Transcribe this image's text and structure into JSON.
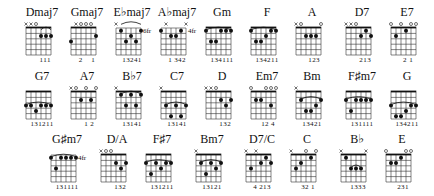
{
  "rows": [
    [
      {
        "name": "Dmaj7",
        "markers": [
          "x",
          "x",
          "o",
          "",
          "",
          ""
        ],
        "dots": [
          [
            3,
            2
          ],
          [
            4,
            2
          ],
          [
            5,
            2
          ]
        ],
        "barre": [
          3,
          5,
          1
        ],
        "pos": "",
        "fingers": "   111"
      },
      {
        "name": "Gmaj7",
        "markers": [
          "",
          "x",
          "o",
          "o",
          "o",
          ""
        ],
        "dots": [
          [
            0,
            3
          ],
          [
            5,
            2
          ]
        ],
        "barre": null,
        "pos": "",
        "fingers": "2    1"
      },
      {
        "name": "E♭maj7",
        "markers": [
          "x",
          "",
          "",
          "",
          "",
          ""
        ],
        "dots": [
          [
            1,
            1
          ],
          [
            2,
            3
          ],
          [
            3,
            2
          ],
          [
            4,
            3
          ],
          [
            5,
            1
          ]
        ],
        "barre": [
          1,
          5,
          0
        ],
        "pos": "6fr",
        "fingers": "13241"
      },
      {
        "name": "A♭maj7",
        "markers": [
          "",
          "x",
          "",
          "",
          "",
          "x"
        ],
        "dots": [
          [
            0,
            1
          ],
          [
            2,
            2
          ],
          [
            3,
            2
          ],
          [
            4,
            1
          ]
        ],
        "barre": null,
        "pos": "4fr",
        "fingers": "1 342"
      },
      {
        "name": "Gm",
        "markers": [
          "",
          "",
          "",
          "",
          "",
          ""
        ],
        "dots": [
          [
            0,
            1
          ],
          [
            1,
            3
          ],
          [
            2,
            3
          ],
          [
            3,
            1
          ],
          [
            4,
            1
          ],
          [
            5,
            1
          ]
        ],
        "barre": [
          0,
          5,
          1
        ],
        "pos": "",
        "fingers": "134111",
        "nut": true
      },
      {
        "name": "F",
        "markers": [
          "",
          "",
          "",
          "",
          "",
          ""
        ],
        "dots": [
          [
            0,
            1
          ],
          [
            1,
            3
          ],
          [
            2,
            3
          ],
          [
            3,
            2
          ],
          [
            4,
            1
          ],
          [
            5,
            1
          ]
        ],
        "barre": [
          0,
          5,
          1
        ],
        "pos": "",
        "fingers": "134211",
        "nut": true
      },
      {
        "name": "A",
        "markers": [
          "x",
          "o",
          "",
          "",
          "",
          "o"
        ],
        "dots": [
          [
            2,
            2
          ],
          [
            3,
            2
          ],
          [
            4,
            2
          ]
        ],
        "barre": null,
        "pos": "",
        "fingers": "  123"
      },
      {
        "name": "D7",
        "markers": [
          "x",
          "x",
          "o",
          "",
          "",
          ""
        ],
        "dots": [
          [
            3,
            2
          ],
          [
            4,
            1
          ],
          [
            5,
            2
          ]
        ],
        "barre": null,
        "pos": "",
        "fingers": "   213"
      },
      {
        "name": "E7",
        "markers": [
          "o",
          "",
          "o",
          "",
          "o",
          "o"
        ],
        "dots": [
          [
            1,
            2
          ],
          [
            3,
            1
          ]
        ],
        "barre": null,
        "pos": "",
        "fingers": " 2 1"
      }
    ],
    [
      {
        "name": "G7",
        "markers": [
          "",
          "",
          "",
          "",
          "",
          ""
        ],
        "dots": [
          [
            0,
            3
          ],
          [
            1,
            3
          ],
          [
            2,
            4
          ],
          [
            3,
            3
          ],
          [
            4,
            3
          ],
          [
            5,
            3
          ]
        ],
        "barre": [
          0,
          5,
          3
        ],
        "pos": "",
        "fingers": "131211",
        "nut": true
      },
      {
        "name": "A7",
        "markers": [
          "x",
          "o",
          "",
          "o",
          "",
          "o"
        ],
        "dots": [
          [
            2,
            2
          ],
          [
            4,
            2
          ]
        ],
        "barre": null,
        "pos": "",
        "fingers": "  1 2"
      },
      {
        "name": "B♭7",
        "markers": [
          "x",
          "",
          "",
          "",
          "",
          ""
        ],
        "dots": [
          [
            1,
            1
          ],
          [
            2,
            3
          ],
          [
            3,
            1
          ],
          [
            4,
            3
          ],
          [
            5,
            1
          ]
        ],
        "barre": [
          1,
          5,
          1
        ],
        "pos": "",
        "fingers": "13141",
        "nut": true
      },
      {
        "name": "C7",
        "markers": [
          "x",
          "",
          "",
          "",
          "",
          ""
        ],
        "dots": [
          [
            1,
            3
          ],
          [
            2,
            5
          ],
          [
            3,
            3
          ],
          [
            4,
            5
          ],
          [
            5,
            3
          ]
        ],
        "barre": [
          1,
          5,
          3
        ],
        "pos": "",
        "fingers": "13141",
        "nut": true
      },
      {
        "name": "D",
        "markers": [
          "x",
          "x",
          "o",
          "",
          "",
          ""
        ],
        "dots": [
          [
            3,
            2
          ],
          [
            4,
            3
          ],
          [
            5,
            2
          ]
        ],
        "barre": null,
        "pos": "",
        "fingers": "   132"
      },
      {
        "name": "Em7",
        "markers": [
          "o",
          "",
          "",
          "o",
          "o",
          "o"
        ],
        "dots": [
          [
            1,
            2
          ],
          [
            2,
            2
          ],
          [
            4,
            3
          ]
        ],
        "barre": null,
        "pos": "",
        "fingers": " 12 4"
      },
      {
        "name": "Bm",
        "markers": [
          "x",
          "",
          "",
          "",
          "",
          ""
        ],
        "dots": [
          [
            1,
            2
          ],
          [
            2,
            4
          ],
          [
            3,
            4
          ],
          [
            4,
            3
          ],
          [
            5,
            2
          ]
        ],
        "barre": [
          1,
          5,
          2
        ],
        "pos": "",
        "fingers": "13421",
        "nut": true
      },
      {
        "name": "F♯m7",
        "markers": [
          "",
          "",
          "",
          "",
          "",
          ""
        ],
        "dots": [
          [
            0,
            2
          ],
          [
            1,
            4
          ],
          [
            2,
            2
          ],
          [
            3,
            2
          ],
          [
            4,
            2
          ],
          [
            5,
            2
          ]
        ],
        "barre": [
          0,
          5,
          2
        ],
        "pos": "",
        "fingers": "131111",
        "nut": true
      },
      {
        "name": "G",
        "markers": [
          "",
          "",
          "",
          "",
          "",
          ""
        ],
        "dots": [
          [
            0,
            3
          ],
          [
            1,
            5
          ],
          [
            2,
            5
          ],
          [
            3,
            4
          ],
          [
            4,
            3
          ],
          [
            5,
            3
          ]
        ],
        "barre": [
          0,
          5,
          3
        ],
        "pos": "",
        "fingers": "134211",
        "nut": true
      }
    ],
    [
      {
        "name": "G♯m7",
        "markers": [
          "",
          "",
          "",
          "",
          "",
          ""
        ],
        "dots": [
          [
            0,
            1
          ],
          [
            1,
            3
          ],
          [
            2,
            1
          ],
          [
            3,
            1
          ],
          [
            4,
            1
          ],
          [
            5,
            1
          ]
        ],
        "barre": [
          0,
          5,
          1
        ],
        "pos": "4fr",
        "fingers": "131111"
      },
      {
        "name": "D/A",
        "markers": [
          "x",
          "o",
          "o",
          "",
          "",
          ""
        ],
        "dots": [
          [
            3,
            2
          ],
          [
            4,
            3
          ],
          [
            5,
            2
          ]
        ],
        "barre": null,
        "pos": "",
        "fingers": "   132"
      },
      {
        "name": "F♯7",
        "markers": [
          "",
          "",
          "",
          "",
          "",
          ""
        ],
        "dots": [
          [
            0,
            2
          ],
          [
            1,
            4
          ],
          [
            2,
            2
          ],
          [
            3,
            3
          ],
          [
            4,
            2
          ],
          [
            5,
            2
          ]
        ],
        "barre": [
          0,
          5,
          2
        ],
        "pos": "",
        "fingers": "131211",
        "nut": true
      },
      {
        "name": "Bm7",
        "markers": [
          "x",
          "",
          "",
          "",
          "",
          ""
        ],
        "dots": [
          [
            1,
            2
          ],
          [
            2,
            4
          ],
          [
            3,
            2
          ],
          [
            4,
            3
          ],
          [
            5,
            2
          ]
        ],
        "barre": [
          1,
          5,
          2
        ],
        "pos": "",
        "fingers": "13121",
        "nut": true
      },
      {
        "name": "D7/C",
        "markers": [
          "x",
          "",
          "x",
          "",
          "",
          ""
        ],
        "dots": [
          [
            1,
            3
          ],
          [
            3,
            2
          ],
          [
            4,
            1
          ],
          [
            5,
            2
          ]
        ],
        "barre": null,
        "pos": "",
        "fingers": "4 213"
      },
      {
        "name": "C",
        "markers": [
          "x",
          "",
          "",
          "o",
          "",
          "o"
        ],
        "dots": [
          [
            1,
            3
          ],
          [
            2,
            2
          ],
          [
            4,
            1
          ]
        ],
        "barre": null,
        "pos": "",
        "fingers": " 32 1"
      },
      {
        "name": "B♭",
        "markers": [
          "x",
          "",
          "",
          "",
          "",
          "x"
        ],
        "dots": [
          [
            1,
            1
          ],
          [
            2,
            3
          ],
          [
            3,
            3
          ],
          [
            4,
            3
          ]
        ],
        "barre": [
          2,
          4,
          3
        ],
        "pos": "",
        "fingers": " 1333"
      },
      {
        "name": "E",
        "markers": [
          "o",
          "",
          "",
          "",
          "o",
          "o"
        ],
        "dots": [
          [
            1,
            2
          ],
          [
            2,
            2
          ],
          [
            3,
            1
          ]
        ],
        "barre": null,
        "pos": "",
        "fingers": " 231"
      }
    ]
  ],
  "layout": {
    "row_y": [
      6,
      70,
      133
    ],
    "row_x": [
      [
        20,
        65,
        110,
        155,
        200,
        245,
        290,
        340,
        385
      ],
      [
        20,
        65,
        110,
        155,
        200,
        245,
        290,
        340,
        385
      ],
      [
        45,
        95,
        140,
        190,
        240,
        285,
        335,
        380
      ]
    ]
  },
  "colors": {
    "ink": "#111111",
    "background": "#ffffff",
    "grid": "#333333"
  }
}
